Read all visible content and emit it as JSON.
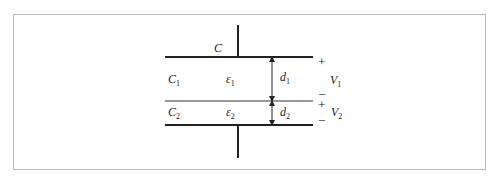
{
  "figure": {
    "type": "series capacitor with two dielectric layers",
    "capacitor_label": "C",
    "layers": [
      {
        "capacitance": "C",
        "capacitance_sub": "1",
        "permittivity": "ε",
        "permittivity_sub": "1",
        "thickness": "d",
        "thickness_sub": "1",
        "voltage": "V",
        "voltage_sub": "1",
        "top_sign": "+",
        "bottom_sign": "−"
      },
      {
        "capacitance": "C",
        "capacitance_sub": "2",
        "permittivity": "ε",
        "permittivity_sub": "2",
        "thickness": "d",
        "thickness_sub": "2",
        "voltage": "V",
        "voltage_sub": "2",
        "top_sign": "+",
        "bottom_sign": "−"
      }
    ]
  }
}
